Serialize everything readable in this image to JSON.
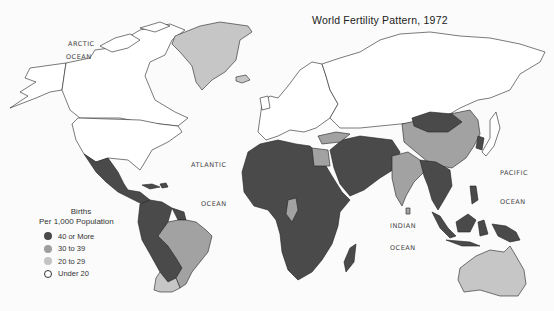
{
  "title": "World Fertility Pattern, 1972",
  "ocean_labels": {
    "arctic": [
      "ARCTIC",
      "OCEAN"
    ],
    "atlantic": [
      "ATLANTIC",
      "OCEAN"
    ],
    "indian": [
      "INDIAN",
      "OCEAN"
    ],
    "pacific": [
      "PACIFIC",
      "OCEAN"
    ]
  },
  "legend": {
    "title_line1": "Births",
    "title_line2": "Per 1,000 Population",
    "items": [
      {
        "label": "40 or More",
        "color": "#4a4a4a"
      },
      {
        "label": "30 to 39",
        "color": "#9e9e9e"
      },
      {
        "label": "20 to 29",
        "color": "#c4c4c4"
      },
      {
        "label": "Under 20",
        "color": "#ffffff"
      }
    ]
  },
  "colors": {
    "high": "#4a4a4a",
    "mid": "#a2a2a2",
    "low": "#c6c6c6",
    "none": "#ffffff",
    "outline": "#222222"
  },
  "regions": [
    {
      "name": "Canada",
      "category": "Under 20"
    },
    {
      "name": "United States",
      "category": "Under 20"
    },
    {
      "name": "Alaska",
      "category": "Under 20"
    },
    {
      "name": "Greenland",
      "category": "20 to 29"
    },
    {
      "name": "Mexico & Central America",
      "category": "40 or More"
    },
    {
      "name": "Northern/Western South America",
      "category": "40 or More"
    },
    {
      "name": "Brazil",
      "category": "30 to 39"
    },
    {
      "name": "Argentina/Chile",
      "category": "20 to 29"
    },
    {
      "name": "Europe",
      "category": "Under 20"
    },
    {
      "name": "USSR",
      "category": "Under 20"
    },
    {
      "name": "Africa",
      "category": "40 or More"
    },
    {
      "name": "Egypt",
      "category": "30 to 39"
    },
    {
      "name": "Middle East",
      "category": "40 or More"
    },
    {
      "name": "Turkey",
      "category": "30 to 39"
    },
    {
      "name": "India",
      "category": "30 to 39"
    },
    {
      "name": "China",
      "category": "30 to 39"
    },
    {
      "name": "Mongolia",
      "category": "40 or More"
    },
    {
      "name": "Southeast Asia",
      "category": "40 or More"
    },
    {
      "name": "Japan",
      "category": "Under 20"
    },
    {
      "name": "Indonesia & New Guinea",
      "category": "40 or More"
    },
    {
      "name": "Australia",
      "category": "20 to 29"
    }
  ]
}
